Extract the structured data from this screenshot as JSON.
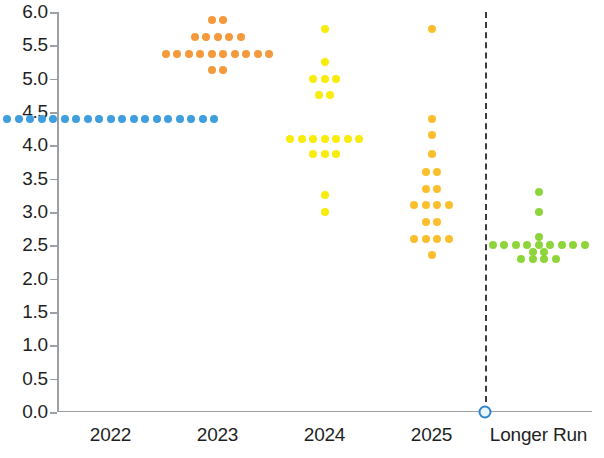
{
  "chart_data": {
    "type": "scatter",
    "title": "",
    "subtitle": "",
    "xlabel": "",
    "ylabel": "",
    "ylim": [
      0.0,
      6.0
    ],
    "ytick_step": 0.5,
    "grid": false,
    "legend": "none",
    "categories": [
      "2022",
      "2023",
      "2024",
      "2025",
      "Longer Run"
    ],
    "ytick_labels": [
      "0.0",
      "0.5",
      "1.0",
      "1.5",
      "2.0",
      "2.5",
      "3.0",
      "3.5",
      "4.0",
      "4.5",
      "5.0",
      "5.5",
      "6.0"
    ],
    "annotations": [
      {
        "name": "longer-run-divider",
        "type": "vertical-dashed-line",
        "between": [
          "2025",
          "Longer Run"
        ]
      },
      {
        "name": "origin-marker",
        "type": "circle-marker",
        "value": 0.0
      }
    ],
    "series": [
      {
        "name": "2022",
        "category": "2022",
        "color": "#3f9ede",
        "rows": [
          {
            "value": 4.4,
            "count": 19
          }
        ]
      },
      {
        "name": "2023",
        "category": "2023",
        "color": "#f49a3c",
        "rows": [
          {
            "value": 5.875,
            "count": 2
          },
          {
            "value": 5.625,
            "count": 5
          },
          {
            "value": 5.375,
            "count": 10
          },
          {
            "value": 5.125,
            "count": 2
          }
        ]
      },
      {
        "name": "2024",
        "category": "2024",
        "color": "#f7ec0a",
        "rows": [
          {
            "value": 5.75,
            "count": 1
          },
          {
            "value": 5.25,
            "count": 1
          },
          {
            "value": 5.0,
            "count": 3
          },
          {
            "value": 4.75,
            "count": 2
          },
          {
            "value": 4.1,
            "count": 7
          },
          {
            "value": 3.875,
            "count": 3
          },
          {
            "value": 3.25,
            "count": 1
          },
          {
            "value": 3.0,
            "count": 1
          }
        ]
      },
      {
        "name": "2025",
        "category": "2025",
        "color": "#fbbf2e",
        "rows": [
          {
            "value": 5.75,
            "count": 1
          },
          {
            "value": 4.4,
            "count": 1
          },
          {
            "value": 4.15,
            "count": 1
          },
          {
            "value": 3.875,
            "count": 1
          },
          {
            "value": 3.6,
            "count": 2
          },
          {
            "value": 3.35,
            "count": 2
          },
          {
            "value": 3.1,
            "count": 4
          },
          {
            "value": 2.85,
            "count": 2
          },
          {
            "value": 2.6,
            "count": 4
          },
          {
            "value": 2.35,
            "count": 1
          }
        ]
      },
      {
        "name": "Longer Run",
        "category": "Longer Run",
        "color": "#8ed53c",
        "rows": [
          {
            "value": 3.3,
            "count": 1
          },
          {
            "value": 3.0,
            "count": 1
          },
          {
            "value": 2.625,
            "count": 1
          },
          {
            "value": 2.5,
            "count": 9
          },
          {
            "value": 2.4,
            "count": 2
          },
          {
            "value": 2.3,
            "count": 4
          }
        ]
      }
    ]
  }
}
